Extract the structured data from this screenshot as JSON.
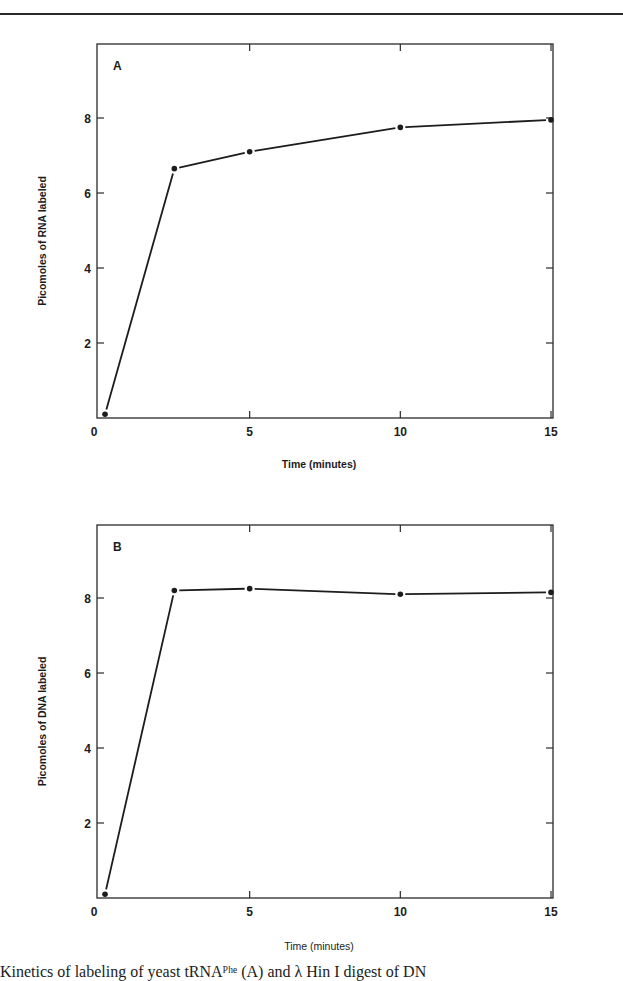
{
  "page": {
    "caption": "Kinetics of labeling of yeast tRNAᴾʰᵉ (A) and λ Hin I digest of DN"
  },
  "chart_data": [
    {
      "type": "line",
      "panel": "A",
      "title": "",
      "xlabel": "Time (minutes)",
      "ylabel": "Picomoles of RNA labeled",
      "x": [
        0.2,
        2.5,
        5,
        10,
        15
      ],
      "series": [
        {
          "name": "RNA labeled",
          "values": [
            0.1,
            6.65,
            7.1,
            7.75,
            7.95
          ]
        }
      ],
      "xticks": [
        "0",
        "5",
        "10",
        "15"
      ],
      "yticks": [
        "2",
        "4",
        "6",
        "8"
      ],
      "xlim": [
        0,
        16.5
      ],
      "ylim": [
        0,
        10
      ],
      "grid": false,
      "legend": "none"
    },
    {
      "type": "line",
      "panel": "B",
      "title": "",
      "xlabel": "Time (minutes)",
      "ylabel": "Picomoles of DNA labeled",
      "x": [
        0.2,
        2.5,
        5,
        10,
        15
      ],
      "series": [
        {
          "name": "DNA labeled",
          "values": [
            0.1,
            8.2,
            8.25,
            8.1,
            8.15
          ]
        }
      ],
      "xticks": [
        "0",
        "5",
        "10",
        "15"
      ],
      "yticks": [
        "2",
        "4",
        "6",
        "8"
      ],
      "xlim": [
        0,
        16.5
      ],
      "ylim": [
        0,
        10
      ],
      "grid": false,
      "legend": "none"
    }
  ]
}
